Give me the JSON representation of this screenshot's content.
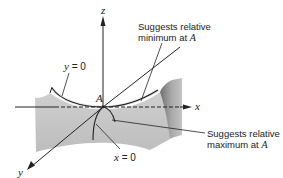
{
  "figure": {
    "type": "3d-saddle-surface",
    "axes": {
      "x_label": "x",
      "y_label": "y",
      "z_label": "z"
    },
    "point": {
      "label": "A"
    },
    "curves": {
      "y0_label_var": "y",
      "y0_label_eq": " = 0",
      "x0_label_var": "x",
      "x0_label_eq": " = 0"
    },
    "annotations": {
      "min_line1": "Suggests relative",
      "min_line2_text": "minimum at ",
      "min_line2_point": "A",
      "max_line1": "Suggests relative",
      "max_line2_text": "maximum at ",
      "max_line2_point": "A"
    },
    "colors": {
      "surface_fill": "#c8c8c8",
      "surface_dark": "#8a8a8a",
      "line": "#222222",
      "background": "#ffffff"
    }
  }
}
